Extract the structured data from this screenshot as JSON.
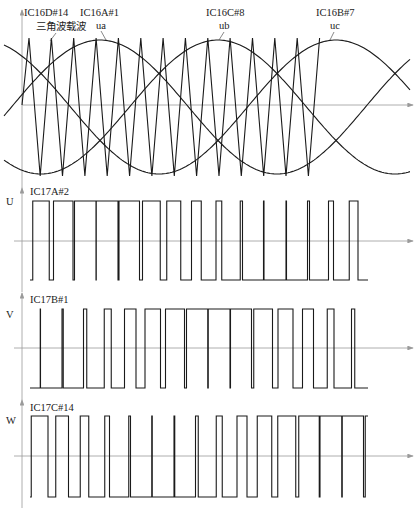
{
  "figure": {
    "width": 416,
    "height": 510,
    "colors": {
      "wave": "#1a1a1a",
      "axis": "#9a9a9a",
      "text": "#222222"
    }
  },
  "top_panel": {
    "labels": {
      "triangle_ic": "IC16D#14",
      "triangle_name": "三角波载波",
      "ua_ic": "IC16A#1",
      "ua_name": "ua",
      "ub_ic": "IC16C#8",
      "ub_name": "ub",
      "uc_ic": "IC16B#7",
      "uc_name": "uc"
    },
    "axis": {
      "x0": 22,
      "x1": 413,
      "y": 105,
      "vtop": 10,
      "vbottom": 188
    },
    "sine": {
      "center": 107,
      "amplitude": 67,
      "period_px": 354,
      "ua_peak_x": 100,
      "x_start": 4,
      "x_end": 410
    },
    "carrier": {
      "x_start": 22,
      "first_peak_x": 29,
      "period_px": 22.35,
      "top": 38,
      "bottom": 176,
      "x_end": 326
    }
  },
  "pwm_panels": [
    {
      "name": "U",
      "label": "U",
      "ic": "IC17A#2",
      "phase": "ua",
      "phase_shift_deg": 0,
      "axis_y": 241,
      "high_y": 201,
      "low_y": 280,
      "vtop": 188,
      "vbottom": 292
    },
    {
      "name": "V",
      "label": "V",
      "ic": "IC17B#1",
      "phase": "ub",
      "phase_shift_deg": -120,
      "axis_y": 348,
      "high_y": 309,
      "low_y": 388,
      "vtop": 293,
      "vbottom": 400
    },
    {
      "name": "W",
      "label": "W",
      "ic": "IC17C#14",
      "phase": "uc",
      "phase_shift_deg": -240,
      "axis_y": 456,
      "high_y": 416,
      "low_y": 497,
      "vtop": 400,
      "vbottom": 508
    }
  ],
  "pwm_x": {
    "start": 22,
    "end": 368,
    "arrow_end": 413
  }
}
